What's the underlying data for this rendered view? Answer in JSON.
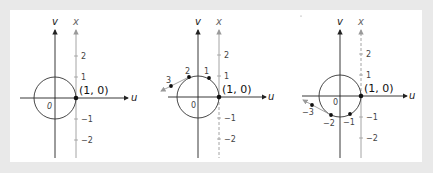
{
  "figure": {
    "colors": {
      "background": "#e9e9e9",
      "panel": "#ffffff",
      "axis": "#222222",
      "number_line": "#8a8a8a",
      "circle": "#333333",
      "point": "#111111"
    },
    "panels": [
      {
        "id": "panel-unwrapped",
        "axis_labels": {
          "u": "u",
          "v": "v",
          "x": "x"
        },
        "origin_label": "0",
        "point_label": "(1, 0)",
        "ticks": [
          {
            "value": "2",
            "pos": 2
          },
          {
            "value": "1",
            "pos": 1
          },
          {
            "value": "−1",
            "pos": -1
          },
          {
            "value": "−2",
            "pos": -2
          }
        ],
        "wrapped_points": []
      },
      {
        "id": "panel-wrap-positive",
        "axis_labels": {
          "u": "u",
          "v": "v",
          "x": "x"
        },
        "origin_label": "0",
        "point_label": "(1, 0)",
        "ticks": [
          {
            "value": "2",
            "pos": 2
          },
          {
            "value": "1",
            "pos": 1
          },
          {
            "value": "−1",
            "pos": -1
          },
          {
            "value": "−2",
            "pos": -2
          }
        ],
        "wrapped_points": [
          {
            "label": "1"
          },
          {
            "label": "2"
          },
          {
            "label": "3"
          }
        ]
      },
      {
        "id": "panel-wrap-negative",
        "axis_labels": {
          "u": "u",
          "v": "v",
          "x": "x"
        },
        "origin_label": "0",
        "point_label": "(1, 0)",
        "ticks": [
          {
            "value": "2",
            "pos": 2
          },
          {
            "value": "1",
            "pos": 1
          },
          {
            "value": "−1",
            "pos": -1
          },
          {
            "value": "−2",
            "pos": -2
          }
        ],
        "wrapped_points": [
          {
            "label": "−1"
          },
          {
            "label": "−2"
          },
          {
            "label": "−3"
          }
        ]
      }
    ]
  }
}
